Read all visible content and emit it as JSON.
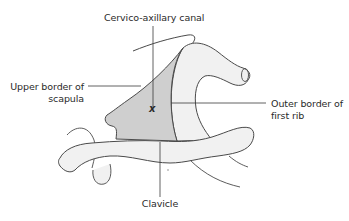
{
  "figure": {
    "type": "anatomical-diagram",
    "subject": "cervico-axillary canal",
    "colors": {
      "background": "#ffffff",
      "outline": "#4a4a4a",
      "bone_fill": "#f1f1f1",
      "canal_fill": "#cfcfcf",
      "leader_line": "#3a3a3a",
      "text": "#2a2a2a"
    },
    "marker": "x",
    "labels": {
      "top": "Cervico-axillary canal",
      "left_line1": "Upper border of",
      "left_line2": "scapula",
      "right_line1": "Outer border of",
      "right_line2": "first rib",
      "bottom": "Clavicle"
    },
    "structures": [
      {
        "name": "scapula-upper-border",
        "label": "Upper border of scapula"
      },
      {
        "name": "first-rib",
        "label": "Outer border of first rib"
      },
      {
        "name": "clavicle",
        "label": "Clavicle"
      },
      {
        "name": "cervico-axillary-canal",
        "label": "Cervico-axillary canal"
      }
    ]
  }
}
